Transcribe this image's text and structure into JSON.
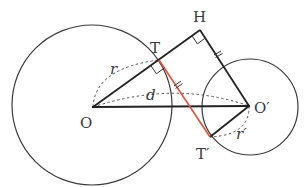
{
  "figure": {
    "type": "geometry-diagram",
    "colors": {
      "stroke": "#2b2b2b",
      "tangent": "#e0523a",
      "dashed": "#555555",
      "text": "#3a3a3a"
    }
  },
  "labels": {
    "O": "O",
    "O_prime": "O′",
    "T": "T",
    "T_prime": "T′",
    "H": "H",
    "r": "r",
    "r_prime": "r′",
    "d": "d"
  },
  "points": {
    "O": [
      93,
      107
    ],
    "O_prime": [
      249,
      106
    ],
    "T": [
      159,
      60
    ],
    "T_prime": [
      210,
      137
    ],
    "H": [
      200,
      30
    ]
  },
  "circles": [
    {
      "center": "O",
      "radius": 80
    },
    {
      "center": "O_prime",
      "radius": 48
    }
  ]
}
